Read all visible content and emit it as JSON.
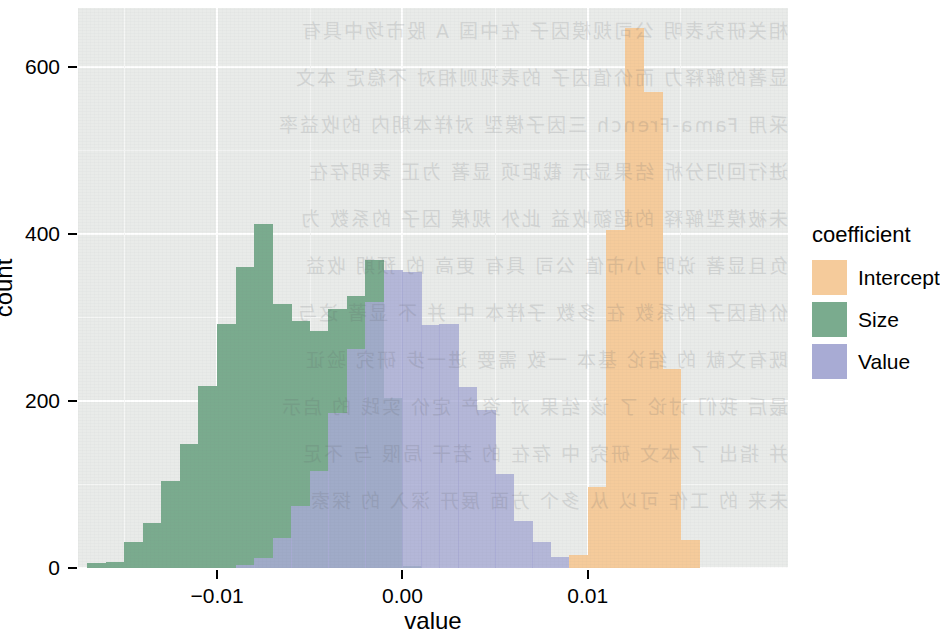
{
  "chart_data": {
    "type": "bar",
    "subtype": "histogram-overlay",
    "title": "",
    "xlabel": "value",
    "ylabel": "count",
    "xlim": [
      -0.0175,
      0.0208
    ],
    "ylim": [
      0,
      670
    ],
    "xticks": [
      "-0.01",
      "0.00",
      "0.01"
    ],
    "xtick_values": [
      -0.01,
      0.0,
      0.01
    ],
    "yticks": [
      "0",
      "200",
      "400",
      "600"
    ],
    "ytick_values": [
      0,
      200,
      400,
      600
    ],
    "grid": "white major and minor gridlines on light gray panel",
    "legend_position": "right",
    "binwidth": 0.001,
    "series": [
      {
        "name": "Intercept",
        "color": "#f5cb9b",
        "bins": [
          {
            "x": 0.0095,
            "value": 15
          },
          {
            "x": 0.0105,
            "value": 97
          },
          {
            "x": 0.0115,
            "value": 404
          },
          {
            "x": 0.0125,
            "value": 646
          },
          {
            "x": 0.0135,
            "value": 570
          },
          {
            "x": 0.0145,
            "value": 238
          },
          {
            "x": 0.0155,
            "value": 34
          }
        ]
      },
      {
        "name": "Size",
        "color": "#7aab8e",
        "bins": [
          {
            "x": -0.0165,
            "value": 6
          },
          {
            "x": -0.0155,
            "value": 7
          },
          {
            "x": -0.0145,
            "value": 31
          },
          {
            "x": -0.0135,
            "value": 54
          },
          {
            "x": -0.0125,
            "value": 104
          },
          {
            "x": -0.0115,
            "value": 148
          },
          {
            "x": -0.0105,
            "value": 218
          },
          {
            "x": -0.0095,
            "value": 292
          },
          {
            "x": -0.0085,
            "value": 360
          },
          {
            "x": -0.0075,
            "value": 411
          },
          {
            "x": -0.0065,
            "value": 316
          },
          {
            "x": -0.0055,
            "value": 296
          },
          {
            "x": -0.0045,
            "value": 283
          },
          {
            "x": -0.0035,
            "value": 310
          },
          {
            "x": -0.0025,
            "value": 325
          },
          {
            "x": -0.0015,
            "value": 369
          },
          {
            "x": -0.0005,
            "value": 203
          },
          {
            "x": 0.0005,
            "value": 3
          }
        ]
      },
      {
        "name": "Value",
        "color": "#a8abd4",
        "bins": [
          {
            "x": -0.0085,
            "value": 4
          },
          {
            "x": -0.0075,
            "value": 12
          },
          {
            "x": -0.0065,
            "value": 36
          },
          {
            "x": -0.0055,
            "value": 74
          },
          {
            "x": -0.0045,
            "value": 116
          },
          {
            "x": -0.0035,
            "value": 186
          },
          {
            "x": -0.0025,
            "value": 262
          },
          {
            "x": -0.0015,
            "value": 318
          },
          {
            "x": -0.0005,
            "value": 356
          },
          {
            "x": 0.0005,
            "value": 354
          },
          {
            "x": 0.0015,
            "value": 291
          },
          {
            "x": 0.0025,
            "value": 292
          },
          {
            "x": 0.0035,
            "value": 216
          },
          {
            "x": 0.0045,
            "value": 189
          },
          {
            "x": 0.0055,
            "value": 113
          },
          {
            "x": 0.0065,
            "value": 56
          },
          {
            "x": 0.0075,
            "value": 31
          },
          {
            "x": 0.0085,
            "value": 13
          },
          {
            "x": 0.0095,
            "value": 4
          }
        ]
      }
    ]
  },
  "axes": {
    "y_label": "count",
    "x_label": "value",
    "y_ticks": [
      "600",
      "400",
      "200",
      "0"
    ],
    "x_ticks": [
      "-0.01",
      "0.00",
      "0.01"
    ]
  },
  "legend": {
    "title": "coefficient",
    "items": [
      {
        "label": "Intercept",
        "color": "#f5cb9b"
      },
      {
        "label": "Size",
        "color": "#7aab8e"
      },
      {
        "label": "Value",
        "color": "#a8abd4"
      }
    ]
  },
  "panel": {
    "background": "#e9ebe9",
    "gridline_color": "#ffffff"
  },
  "bleed_text": "相关研究表明 公司规模因子 在中国 A 股市场中具有\n显著的解释力 而价值因子 的表现则相对 不稳定 本文\n采用 Fama-French 三因子模型 对样本期内 的收益率\n进行回归分析 结果显示 截距项 显著 为正 表明存在\n未被模型解释 的超额收益 此外 规模 因子 的系数 为\n负且显著 说明 小市值 公司 具有 更高 的 预期 收益\n价值因子 的系数 在 多数 子样本 中 并 不 显著 这与\n既有文献 的 结论 基本 一致 需要 进一步 研究 验证\n最后 我们 讨论 了 该 结果 对 资产 定价 实践 的 启示\n并 指出 了 本文 研究 中 存在 的 若干 局限 与 不足\n未来 的 工作 可以 从 多个 方面 展开 深入 的 探索"
}
